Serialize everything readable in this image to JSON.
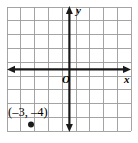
{
  "figure": {
    "kind": "coordinate-plane-diagram",
    "width": 138,
    "height": 143,
    "background_color": "#ffffff"
  },
  "grid": {
    "columns": 9,
    "rows": 9,
    "cell_size": 13.8,
    "left": 7,
    "top": 7,
    "right": 131.2,
    "bottom": 131.2,
    "line_color": "#9a9a9a",
    "border_color": "#9a9a9a",
    "line_width": 0.9
  },
  "axes": {
    "color": "#1a1a1a",
    "line_width": 2.2,
    "origin_x": 69.4,
    "origin_y": 69.4,
    "x_axis": {
      "label": "x",
      "label_name": "x-axis-label",
      "arrow_left": true,
      "arrow_right": true,
      "start_x": 9,
      "end_x": 130
    },
    "y_axis": {
      "label": "y",
      "label_name": "y-axis-label",
      "arrow_up": true,
      "arrow_down": true,
      "start_y": 9,
      "end_y": 130
    },
    "origin_label": "O"
  },
  "points": [
    {
      "label": "(–3, –4)",
      "x_value": -3,
      "y_value": -4,
      "px": 31.0,
      "py": 124.6,
      "radius": 3.0,
      "color": "#1a1a1a"
    }
  ]
}
